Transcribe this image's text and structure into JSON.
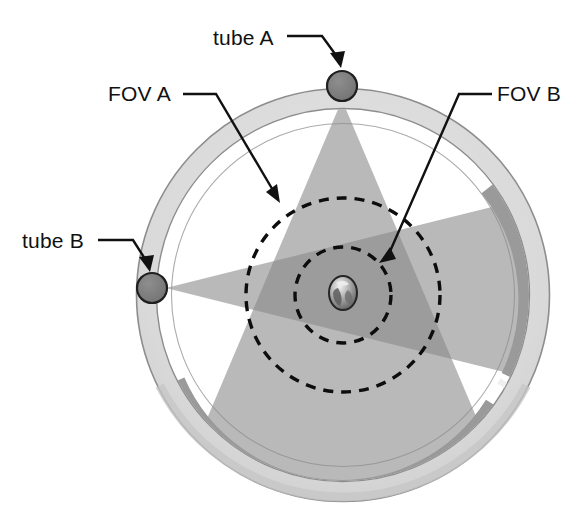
{
  "figure": {
    "kind": "diagram",
    "background_color": "#ffffff"
  },
  "geometry": {
    "center": {
      "x": 343,
      "y": 295
    },
    "gantry_outer_radius": 207,
    "gantry_inner_radius": 187,
    "detector_band_outer_radius": 185,
    "detector_band_inner_radius": 172,
    "fov_a_radius": 97,
    "fov_b_radius": 48,
    "tube_radius": 15
  },
  "colors": {
    "ring_fill": "#d9d9d9",
    "ring_edge": "#8d8d8d",
    "bore_fill": "#ffffff",
    "fan_a_fill": "#b9b9b9",
    "fan_b_fill": "#b9b9b9",
    "fan_overlap_fill": "#9c9c9c",
    "detector_fill": "#9a9a9a",
    "tube_fill": "#7c7c7c",
    "tube_stroke": "#1f1f1f",
    "dashed_stroke": "#0d0d0d",
    "label_text": "#111111",
    "leader_line": "#111111"
  },
  "labels": [
    {
      "id": "tube-a",
      "text": "tube A",
      "text_x": 213,
      "text_y": 45,
      "anchor": "start",
      "leader_path": "M 287 36 L 322 36 L 341 62",
      "arrow_at": {
        "x": 341,
        "y": 62,
        "angle": 54
      },
      "describes": "x-ray tube A mounted on the gantry at the 12 o'clock position"
    },
    {
      "id": "fov-a",
      "text": "FOV A",
      "text_x": 108,
      "text_y": 101,
      "anchor": "start",
      "leader_path": "M 183 94 L 216 94 L 278 199",
      "arrow_at": {
        "x": 278,
        "y": 199,
        "angle": 59
      },
      "describes": "large dashed circle: field of view of tube A"
    },
    {
      "id": "fov-b",
      "text": "FOV B",
      "text_x": 495,
      "text_y": 101,
      "anchor": "start",
      "leader_path": "M 490 94 L 459 94 L 382 259",
      "arrow_at": {
        "x": 382,
        "y": 259,
        "angle": 115
      },
      "describes": "small dashed circle: field of view of tube B"
    },
    {
      "id": "tube-b",
      "text": "tube B",
      "text_x": 22,
      "text_y": 248,
      "anchor": "start",
      "leader_path": "M 98 240 L 133 240 L 150 266",
      "arrow_at": {
        "x": 150,
        "y": 266,
        "angle": 57
      },
      "describes": "x-ray tube B mounted on the gantry at the 9 o'clock position"
    }
  ],
  "tubes": [
    {
      "id": "tube-a",
      "label": "tube A",
      "cx": 342,
      "cy": 86,
      "r": 15,
      "angle_deg": 270
    },
    {
      "id": "tube-b",
      "label": "tube B",
      "cx": 152,
      "cy": 288,
      "r": 15,
      "angle_deg": 182
    }
  ],
  "fans": [
    {
      "id": "fan-a",
      "source": "tube A",
      "apex": {
        "x": 342,
        "y": 100
      },
      "half_angle_deg": 23,
      "direction_deg": 90,
      "fill": "#b9b9b9",
      "reaches_radius": 185
    },
    {
      "id": "fan-b",
      "source": "tube B",
      "apex": {
        "x": 166,
        "y": 288
      },
      "half_angle_deg": 14,
      "direction_deg": 0,
      "fill": "#b9b9b9",
      "reaches_radius": 185
    }
  ],
  "fov_circles": [
    {
      "id": "fov-a",
      "label": "FOV A",
      "cx": 343,
      "cy": 295,
      "r": 97,
      "style": "dashed"
    },
    {
      "id": "fov-b",
      "label": "FOV B",
      "cx": 343,
      "cy": 295,
      "r": 48,
      "style": "dashed"
    }
  ],
  "detector_arcs": [
    {
      "id": "detector-a",
      "serves": "tube A",
      "start_deg": 36,
      "end_deg": 158,
      "fill": "#9a9a9a"
    },
    {
      "id": "detector-b",
      "serves": "tube B",
      "start_deg": -54,
      "end_deg": 26,
      "fill": "#9a9a9a"
    }
  ],
  "center_object": {
    "id": "scanned-object",
    "description": "small scanned object at isocenter",
    "cx": 343,
    "cy": 293,
    "rx": 14,
    "ry": 17
  }
}
